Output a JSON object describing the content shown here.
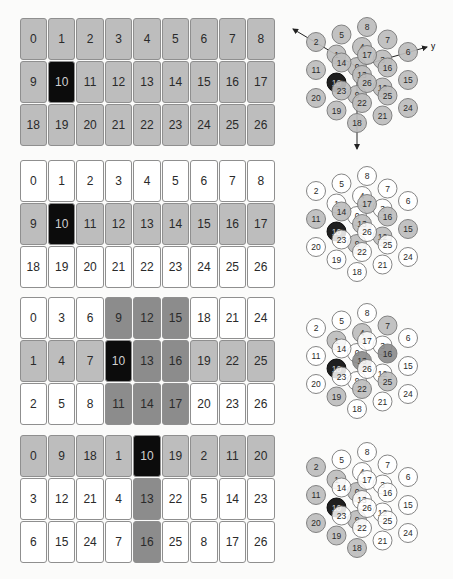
{
  "colors": {
    "white": "#ffffff",
    "light": "#bdbdbd",
    "dark": "#8c8c8c",
    "black": "#0c0c0c",
    "border": "#8f8f8f"
  },
  "panels": [
    {
      "grid_top": 17,
      "grid": [
        [
          {
            "v": "0",
            "c": "light"
          },
          {
            "v": "1",
            "c": "light"
          },
          {
            "v": "2",
            "c": "light"
          },
          {
            "v": "3",
            "c": "light"
          },
          {
            "v": "4",
            "c": "light"
          },
          {
            "v": "5",
            "c": "light"
          },
          {
            "v": "6",
            "c": "light"
          },
          {
            "v": "7",
            "c": "light"
          },
          {
            "v": "8",
            "c": "light"
          }
        ],
        [
          {
            "v": "9",
            "c": "light"
          },
          {
            "v": "10",
            "c": "black"
          },
          {
            "v": "11",
            "c": "light"
          },
          {
            "v": "12",
            "c": "light"
          },
          {
            "v": "13",
            "c": "light"
          },
          {
            "v": "14",
            "c": "light"
          },
          {
            "v": "15",
            "c": "light"
          },
          {
            "v": "16",
            "c": "light"
          },
          {
            "v": "17",
            "c": "light"
          }
        ],
        [
          {
            "v": "18",
            "c": "light"
          },
          {
            "v": "19",
            "c": "light"
          },
          {
            "v": "20",
            "c": "light"
          },
          {
            "v": "21",
            "c": "light"
          },
          {
            "v": "22",
            "c": "light"
          },
          {
            "v": "23",
            "c": "light"
          },
          {
            "v": "24",
            "c": "light"
          },
          {
            "v": "25",
            "c": "light"
          },
          {
            "v": "26",
            "c": "light"
          }
        ]
      ],
      "diagram_top": 0,
      "origin": [
        67,
        67
      ],
      "axes": true,
      "axis_labels": {
        "x": "x",
        "y": "y",
        "z": "z"
      },
      "node_colors": {
        "default": "light",
        "10": "black"
      }
    },
    {
      "grid_top": 159,
      "grid": [
        [
          {
            "v": "0",
            "c": "white"
          },
          {
            "v": "1",
            "c": "white"
          },
          {
            "v": "2",
            "c": "white"
          },
          {
            "v": "3",
            "c": "white"
          },
          {
            "v": "4",
            "c": "white"
          },
          {
            "v": "5",
            "c": "white"
          },
          {
            "v": "6",
            "c": "white"
          },
          {
            "v": "7",
            "c": "white"
          },
          {
            "v": "8",
            "c": "white"
          }
        ],
        [
          {
            "v": "9",
            "c": "light"
          },
          {
            "v": "10",
            "c": "black"
          },
          {
            "v": "11",
            "c": "light"
          },
          {
            "v": "12",
            "c": "light"
          },
          {
            "v": "13",
            "c": "light"
          },
          {
            "v": "14",
            "c": "light"
          },
          {
            "v": "15",
            "c": "light"
          },
          {
            "v": "16",
            "c": "light"
          },
          {
            "v": "17",
            "c": "light"
          }
        ],
        [
          {
            "v": "18",
            "c": "white"
          },
          {
            "v": "19",
            "c": "white"
          },
          {
            "v": "20",
            "c": "white"
          },
          {
            "v": "21",
            "c": "white"
          },
          {
            "v": "22",
            "c": "white"
          },
          {
            "v": "23",
            "c": "white"
          },
          {
            "v": "24",
            "c": "white"
          },
          {
            "v": "25",
            "c": "white"
          },
          {
            "v": "26",
            "c": "white"
          }
        ]
      ],
      "diagram_top": 150,
      "origin": [
        67,
        66
      ],
      "axes": false,
      "node_colors": {
        "default": "white",
        "9": "light",
        "10": "black",
        "11": "light",
        "12": "light",
        "13": "light",
        "14": "light",
        "15": "light",
        "16": "light",
        "17": "light"
      }
    },
    {
      "grid_top": 296,
      "grid": [
        [
          {
            "v": "0",
            "c": "white"
          },
          {
            "v": "3",
            "c": "white"
          },
          {
            "v": "6",
            "c": "white"
          },
          {
            "v": "9",
            "c": "dark"
          },
          {
            "v": "12",
            "c": "dark"
          },
          {
            "v": "15",
            "c": "dark"
          },
          {
            "v": "18",
            "c": "white"
          },
          {
            "v": "21",
            "c": "white"
          },
          {
            "v": "24",
            "c": "white"
          }
        ],
        [
          {
            "v": "1",
            "c": "light"
          },
          {
            "v": "4",
            "c": "light"
          },
          {
            "v": "7",
            "c": "light"
          },
          {
            "v": "10",
            "c": "black"
          },
          {
            "v": "13",
            "c": "dark"
          },
          {
            "v": "16",
            "c": "dark"
          },
          {
            "v": "19",
            "c": "light"
          },
          {
            "v": "22",
            "c": "light"
          },
          {
            "v": "25",
            "c": "light"
          }
        ],
        [
          {
            "v": "2",
            "c": "white"
          },
          {
            "v": "5",
            "c": "white"
          },
          {
            "v": "8",
            "c": "white"
          },
          {
            "v": "11",
            "c": "dark"
          },
          {
            "v": "14",
            "c": "dark"
          },
          {
            "v": "17",
            "c": "dark"
          },
          {
            "v": "20",
            "c": "white"
          },
          {
            "v": "23",
            "c": "white"
          },
          {
            "v": "26",
            "c": "white"
          }
        ]
      ],
      "diagram_top": 295,
      "origin": [
        67,
        58
      ],
      "axes": false,
      "node_colors": {
        "default": "white",
        "1": "light",
        "4": "light",
        "7": "light",
        "10": "black",
        "13": "dark",
        "16": "dark",
        "19": "light",
        "22": "light",
        "25": "light"
      }
    },
    {
      "grid_top": 434,
      "grid": [
        [
          {
            "v": "0",
            "c": "light"
          },
          {
            "v": "9",
            "c": "light"
          },
          {
            "v": "18",
            "c": "light"
          },
          {
            "v": "1",
            "c": "light"
          },
          {
            "v": "10",
            "c": "black"
          },
          {
            "v": "19",
            "c": "light"
          },
          {
            "v": "2",
            "c": "light"
          },
          {
            "v": "11",
            "c": "light"
          },
          {
            "v": "20",
            "c": "light"
          }
        ],
        [
          {
            "v": "3",
            "c": "white"
          },
          {
            "v": "12",
            "c": "white"
          },
          {
            "v": "21",
            "c": "white"
          },
          {
            "v": "4",
            "c": "white"
          },
          {
            "v": "13",
            "c": "dark"
          },
          {
            "v": "22",
            "c": "white"
          },
          {
            "v": "5",
            "c": "white"
          },
          {
            "v": "14",
            "c": "white"
          },
          {
            "v": "23",
            "c": "white"
          }
        ],
        [
          {
            "v": "6",
            "c": "white"
          },
          {
            "v": "15",
            "c": "white"
          },
          {
            "v": "24",
            "c": "white"
          },
          {
            "v": "7",
            "c": "white"
          },
          {
            "v": "16",
            "c": "dark"
          },
          {
            "v": "25",
            "c": "white"
          },
          {
            "v": "8",
            "c": "white"
          },
          {
            "v": "17",
            "c": "white"
          },
          {
            "v": "26",
            "c": "white"
          }
        ]
      ],
      "diagram_top": 430,
      "origin": [
        67,
        62
      ],
      "axes": false,
      "node_colors": {
        "default": "white",
        "0": "light",
        "1": "light",
        "2": "light",
        "9": "light",
        "10": "black",
        "11": "light",
        "18": "light",
        "19": "light",
        "20": "light"
      }
    }
  ]
}
